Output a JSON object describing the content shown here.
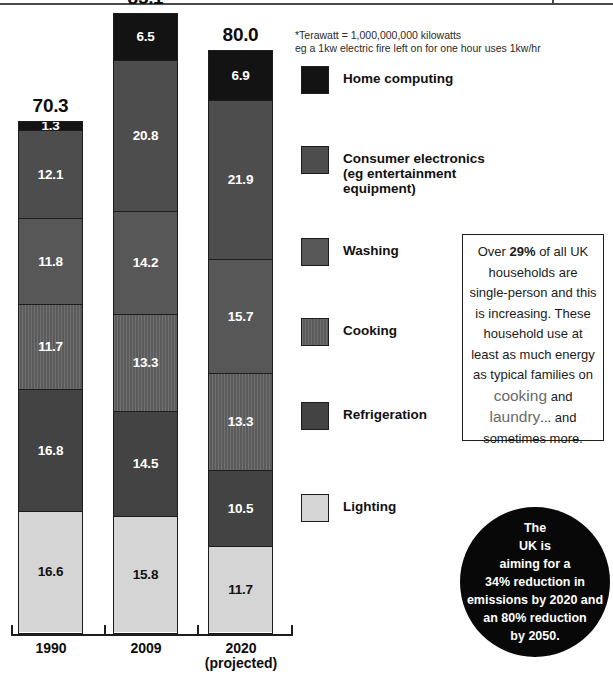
{
  "footnote": {
    "line1": "*Terawatt = 1,000,000,000 kilowatts",
    "line2": "eg a 1kw electric fire left on for one hour uses 1kw/hr"
  },
  "legend": {
    "items": [
      {
        "label": "Home computing",
        "color": "#131313",
        "swatch_name": "legend-swatch-home-computing"
      },
      {
        "label": "Consumer electronics\n(eg entertainment\nequipment)",
        "color": "#4d4d4d",
        "swatch_name": "legend-swatch-consumer-electronics"
      },
      {
        "label": "Washing",
        "color": "#575757",
        "swatch_name": "legend-swatch-washing"
      },
      {
        "label": "Cooking",
        "color": "#606060",
        "swatch_name": "legend-swatch-cooking"
      },
      {
        "label": "Refrigeration",
        "color": "#434343",
        "swatch_name": "legend-swatch-refrigeration"
      },
      {
        "label": "Lighting",
        "color": "#d5d5d5",
        "swatch_name": "legend-swatch-lighting"
      }
    ]
  },
  "callout": {
    "text_before_29": "Over ",
    "pct_29": "29%",
    "text_after_29": " of all UK households are single-person and this is increasing. These household use at least as much energy as typical families on ",
    "word_cooking": "cooking",
    "text_and": " and ",
    "word_laundry": "laundry",
    "text_end": "... and sometimes more."
  },
  "circle_stat": {
    "line1": "The",
    "line2": "UK is",
    "line3": "aiming for a",
    "line4": "34% reduction in",
    "line5": "emissions by 2020 and",
    "line6": "an 80% reduction",
    "line7": "by 2050."
  },
  "chart_data": {
    "type": "bar",
    "subtype": "stacked-vertical",
    "title": "",
    "xlabel": "",
    "ylabel": "",
    "unit": "Terawatt hours",
    "grid": false,
    "legend_position": "right",
    "categories": [
      "1990",
      "2009",
      "2020\n(projected)"
    ],
    "category_labels_flat": [
      "1990",
      "2009",
      "2020 (projected)"
    ],
    "totals": [
      "70.3",
      "85.1",
      "80.0"
    ],
    "totals_numeric": [
      70.3,
      85.1,
      80.0
    ],
    "series_order_top_to_bottom": [
      "Home computing",
      "Consumer electronics",
      "Washing",
      "Cooking",
      "Refrigeration",
      "Lighting"
    ],
    "series": [
      {
        "name": "Home computing",
        "color": "#131313",
        "values": [
          1.3,
          6.5,
          6.9
        ],
        "labels": [
          "1.3",
          "6.5",
          "6.9"
        ]
      },
      {
        "name": "Consumer electronics",
        "color": "#4d4d4d",
        "values": [
          12.1,
          20.8,
          21.9
        ],
        "labels": [
          "12.1",
          "20.8",
          "21.9"
        ]
      },
      {
        "name": "Washing",
        "color": "#575757",
        "values": [
          11.8,
          14.2,
          15.7
        ],
        "labels": [
          "11.8",
          "14.2",
          "15.7"
        ]
      },
      {
        "name": "Cooking",
        "color": "#606060",
        "values": [
          11.7,
          13.3,
          13.3
        ],
        "labels": [
          "11.7",
          "13.3",
          "13.3"
        ]
      },
      {
        "name": "Refrigeration",
        "color": "#434343",
        "values": [
          16.8,
          14.5,
          10.5
        ],
        "labels": [
          "16.8",
          "14.5",
          "10.5"
        ]
      },
      {
        "name": "Lighting",
        "color": "#d5d5d5",
        "values": [
          16.6,
          15.8,
          11.7
        ],
        "labels": [
          "16.6",
          "15.8",
          "11.7"
        ]
      }
    ],
    "ylim": [
      0,
      85.1
    ]
  },
  "bars": [
    {
      "total": "70.3",
      "axis_label_line1": "1990",
      "axis_label_line2": "",
      "segments": [
        {
          "label": "1.3",
          "cls": "fill-home",
          "lab": "lab-dark",
          "h": 9,
          "name": "bar-segment-home-computing"
        },
        {
          "label": "12.1",
          "cls": "fill-consum",
          "lab": "lab-dark",
          "h": 88,
          "name": "bar-segment-consumer-electronics"
        },
        {
          "label": "11.8",
          "cls": "fill-wash",
          "lab": "lab-dark",
          "h": 86,
          "name": "bar-segment-washing"
        },
        {
          "label": "11.7",
          "cls": "fill-cook",
          "lab": "lab-dark",
          "h": 85,
          "name": "bar-segment-cooking"
        },
        {
          "label": "16.8",
          "cls": "fill-refrig",
          "lab": "lab-dark",
          "h": 122,
          "name": "bar-segment-refrigeration"
        },
        {
          "label": "16.6",
          "cls": "fill-light",
          "lab": "lab-light",
          "h": 120,
          "name": "bar-segment-lighting"
        }
      ]
    },
    {
      "total": "85.1",
      "axis_label_line1": "2009",
      "axis_label_line2": "",
      "segments": [
        {
          "label": "6.5",
          "cls": "fill-home",
          "lab": "lab-dark",
          "h": 47,
          "name": "bar-segment-home-computing"
        },
        {
          "label": "20.8",
          "cls": "fill-consum",
          "lab": "lab-dark",
          "h": 151,
          "name": "bar-segment-consumer-electronics"
        },
        {
          "label": "14.2",
          "cls": "fill-wash",
          "lab": "lab-dark",
          "h": 103,
          "name": "bar-segment-washing"
        },
        {
          "label": "13.3",
          "cls": "fill-cook",
          "lab": "lab-dark",
          "h": 97,
          "name": "bar-segment-cooking"
        },
        {
          "label": "14.5",
          "cls": "fill-refrig",
          "lab": "lab-dark",
          "h": 105,
          "name": "bar-segment-refrigeration"
        },
        {
          "label": "15.8",
          "cls": "fill-light",
          "lab": "lab-light",
          "h": 115,
          "name": "bar-segment-lighting"
        }
      ]
    },
    {
      "total": "80.0",
      "axis_label_line1": "2020",
      "axis_label_line2": "(projected)",
      "segments": [
        {
          "label": "6.9",
          "cls": "fill-home",
          "lab": "lab-dark",
          "h": 50,
          "name": "bar-segment-home-computing"
        },
        {
          "label": "21.9",
          "cls": "fill-consum",
          "lab": "lab-dark",
          "h": 159,
          "name": "bar-segment-consumer-electronics"
        },
        {
          "label": "15.7",
          "cls": "fill-wash",
          "lab": "lab-dark",
          "h": 114,
          "name": "bar-segment-washing"
        },
        {
          "label": "13.3",
          "cls": "fill-cook",
          "lab": "lab-dark",
          "h": 97,
          "name": "bar-segment-cooking"
        },
        {
          "label": "10.5",
          "cls": "fill-refrig",
          "lab": "lab-dark",
          "h": 76,
          "name": "bar-segment-refrigeration"
        },
        {
          "label": "11.7",
          "cls": "fill-light",
          "lab": "lab-light",
          "h": 85,
          "name": "bar-segment-lighting"
        }
      ]
    }
  ]
}
